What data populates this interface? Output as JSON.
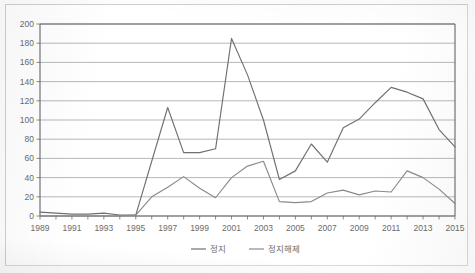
{
  "chart_data": {
    "type": "line",
    "title": "",
    "xlabel": "",
    "ylabel": "",
    "ylim": [
      0,
      200
    ],
    "ytick_step": 20,
    "yticks": [
      0,
      20,
      40,
      60,
      80,
      100,
      120,
      140,
      160,
      180,
      200
    ],
    "ytick_labels": [
      "0",
      "20",
      "40",
      "60",
      "80",
      "100",
      "120",
      "140",
      "160",
      "180",
      "200"
    ],
    "grid": true,
    "grid_axis": "y",
    "legend_position": "bottom",
    "x": [
      1989,
      1990,
      1991,
      1992,
      1993,
      1994,
      1995,
      1996,
      1997,
      1998,
      1999,
      2000,
      2001,
      2002,
      2003,
      2004,
      2005,
      2006,
      2007,
      2008,
      2009,
      2010,
      2011,
      2012,
      2013,
      2014,
      2015
    ],
    "xtick_labels": [
      "1989",
      "1991",
      "1993",
      "1995",
      "1997",
      "1999",
      "2001",
      "2003",
      "2005",
      "2007",
      "2009",
      "2011",
      "2013",
      "2015"
    ],
    "xtick_values": [
      1989,
      1991,
      1993,
      1995,
      1997,
      1999,
      2001,
      2003,
      2005,
      2007,
      2009,
      2011,
      2013,
      2015
    ],
    "xlim": [
      1989,
      2015
    ],
    "series": [
      {
        "name": "정지",
        "color": "#707070",
        "values": [
          4,
          3,
          2,
          2,
          3,
          1,
          1,
          57,
          113,
          66,
          66,
          70,
          185,
          147,
          100,
          38,
          47,
          75,
          56,
          92,
          101,
          118,
          134,
          129,
          122,
          90,
          72
        ]
      },
      {
        "name": "정지해제",
        "color": "#8a8a8a",
        "values": [
          0,
          0,
          0,
          0,
          0,
          0,
          1,
          20,
          30,
          41,
          29,
          19,
          40,
          52,
          57,
          15,
          14,
          15,
          24,
          27,
          22,
          26,
          25,
          47,
          40,
          28,
          13
        ]
      }
    ]
  },
  "legend": {
    "items": [
      {
        "label": "정지"
      },
      {
        "label": "정지해제"
      }
    ]
  }
}
